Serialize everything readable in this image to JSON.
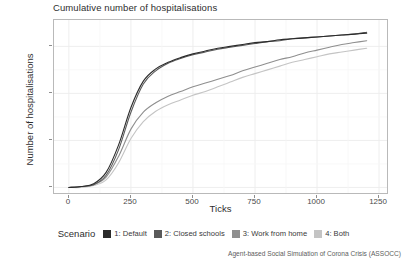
{
  "chart_data": {
    "type": "line",
    "title": "Cumulative number of hospitalisations",
    "xlabel": "Ticks",
    "ylabel": "Number of hospitalisations",
    "xlim": [
      -60,
      1290
    ],
    "ylim": [
      -8,
      178
    ],
    "xticks": [
      0,
      250,
      500,
      750,
      1000,
      1250
    ],
    "xtick_labels": [
      "0",
      "250",
      "500",
      "750",
      "1000",
      "1250"
    ],
    "yticks": [
      0,
      50,
      100,
      150
    ],
    "ytick_labels": [
      "0",
      "50",
      "100",
      "150"
    ],
    "grid": true,
    "legend_position": "bottom",
    "legend_title": "Scenario",
    "x": [
      0,
      50,
      100,
      150,
      200,
      250,
      300,
      350,
      400,
      450,
      500,
      550,
      600,
      650,
      700,
      750,
      800,
      850,
      900,
      950,
      1000,
      1050,
      1100,
      1150,
      1200
    ],
    "series": [
      {
        "name": "1: Default",
        "color": "#2b2b2b",
        "values": [
          0,
          1,
          4,
          16,
          45,
          85,
          113,
          126,
          133,
          138,
          142,
          145,
          148,
          150,
          152,
          154,
          155,
          157,
          158,
          159,
          160,
          161,
          162,
          163,
          164
        ]
      },
      {
        "name": "2: Closed schools",
        "color": "#5a5a5a",
        "values": [
          0,
          1,
          3,
          13,
          40,
          80,
          110,
          124,
          132,
          137,
          141,
          144,
          147,
          149,
          151,
          153,
          155,
          156,
          158,
          159,
          160,
          161,
          162,
          163,
          165
        ]
      },
      {
        "name": "3: Work from home",
        "color": "#8f8f8f",
        "values": [
          0,
          1,
          3,
          11,
          33,
          62,
          80,
          90,
          97,
          102,
          107,
          111,
          115,
          119,
          124,
          128,
          132,
          136,
          139,
          143,
          146,
          149,
          152,
          154,
          156
        ]
      },
      {
        "name": "4: Both",
        "color": "#c4c4c4",
        "values": [
          0,
          0,
          2,
          8,
          26,
          52,
          70,
          81,
          88,
          93,
          98,
          102,
          107,
          112,
          117,
          121,
          125,
          129,
          133,
          136,
          139,
          142,
          144,
          146,
          148
        ]
      }
    ]
  },
  "caption": "Agent-based Social Simulation of Corona Crisis (ASSOCC)"
}
